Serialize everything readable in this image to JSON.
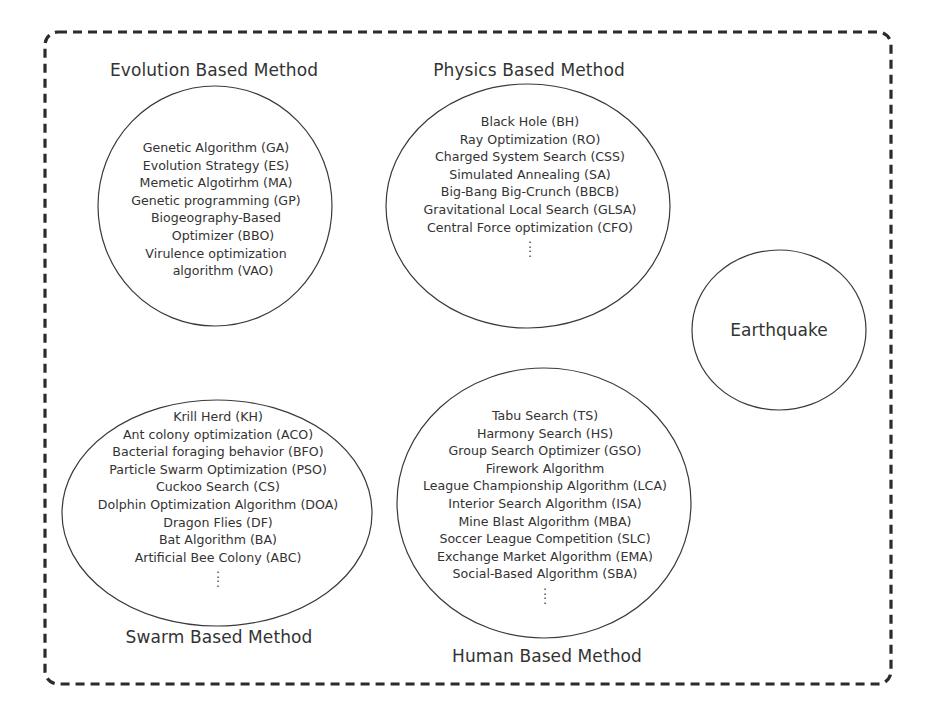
{
  "diagram": {
    "border_style": "dashed-rounded",
    "colors": {
      "stroke": "#2b2b2b",
      "text": "#333333",
      "background": "#ffffff"
    }
  },
  "groups": {
    "evolution": {
      "title": "Evolution Based Method",
      "items": [
        "Genetic Algorithm (GA)",
        "Evolution Strategy (ES)",
        "Memetic Algotirhm (MA)",
        "Genetic programming (GP)",
        "Biogeography-Based",
        "Optimizer (BBO)",
        "Virulence optimization",
        "algorithm (VAO)"
      ]
    },
    "physics": {
      "title": "Physics Based Method",
      "items": [
        "Black Hole (BH)",
        "Ray Optimization (RO)",
        "Charged System Search (CSS)",
        "Simulated Annealing (SA)",
        "Big-Bang Big-Crunch (BBCB)",
        "Gravitational Local Search (GLSA)",
        "Central Force optimization (CFO)"
      ],
      "ellipsis": ":"
    },
    "earthquake": {
      "title": "Earthquake"
    },
    "swarm": {
      "title": "Swarm Based Method",
      "items": [
        "Krill Herd (KH)",
        "Ant colony optimization (ACO)",
        "Bacterial foraging behavior (BFO)",
        "Particle Swarm Optimization (PSO)",
        "Cuckoo Search (CS)",
        "Dolphin Optimization Algorithm (DOA)",
        "Dragon Flies (DF)",
        "Bat Algorithm (BA)",
        "Artificial Bee Colony (ABC)"
      ],
      "ellipsis": ":"
    },
    "human": {
      "title": "Human Based Method",
      "items": [
        "Tabu Search (TS)",
        "Harmony Search (HS)",
        "Group Search Optimizer (GSO)",
        "Firework Algorithm",
        "League Championship Algorithm (LCA)",
        "Interior Search Algorithm (ISA)",
        "Mine Blast Algorithm (MBA)",
        "Soccer League Competition (SLC)",
        "Exchange Market Algorithm (EMA)",
        "Social-Based Algorithm (SBA)"
      ],
      "ellipsis": ":"
    }
  }
}
